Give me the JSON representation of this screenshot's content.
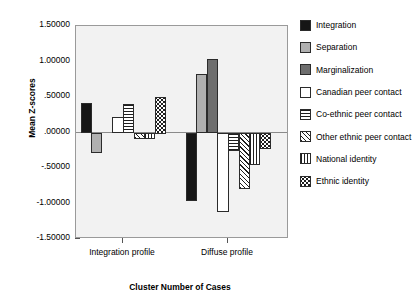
{
  "chart_data": {
    "type": "bar",
    "title": "",
    "xlabel": "Cluster Number of Cases",
    "ylabel": "Mean Z-scores",
    "categories": [
      "Integration profile",
      "Diffuse profile"
    ],
    "ylim": [
      -1.5,
      1.5
    ],
    "ytick_labels": [
      "1.50000",
      "1.00000",
      ".50000",
      ".00000",
      "-.50000",
      "-1.00000",
      "-1.50000"
    ],
    "ytick_values": [
      1.5,
      1.0,
      0.5,
      0.0,
      -0.5,
      -1.0,
      -1.5
    ],
    "grid": false,
    "legend_position": "right",
    "series": [
      {
        "name": "Integration",
        "pattern": "solid-black",
        "values": [
          0.42,
          -0.95
        ]
      },
      {
        "name": "Separation",
        "pattern": "solid-light-gray",
        "values": [
          -0.28,
          0.83
        ]
      },
      {
        "name": "Marginalization",
        "pattern": "solid-dark-gray",
        "values": [
          0.0,
          1.03
        ]
      },
      {
        "name": "Canadian peer contact",
        "pattern": "white",
        "values": [
          0.22,
          -1.1
        ]
      },
      {
        "name": "Co-ethnic peer contact",
        "pattern": "horizontal-lines",
        "values": [
          0.4,
          -0.25
        ]
      },
      {
        "name": "Other ethnic peer contact",
        "pattern": "diagonal-hatch",
        "values": [
          -0.08,
          -0.78
        ]
      },
      {
        "name": "National identity",
        "pattern": "vertical-lines",
        "values": [
          -0.08,
          -0.45
        ]
      },
      {
        "name": "Ethnic identity",
        "pattern": "dotted",
        "values": [
          0.5,
          -0.22
        ]
      }
    ]
  },
  "legend": {
    "items": [
      {
        "label": "Integration"
      },
      {
        "label": "Separation"
      },
      {
        "label": "Marginalization"
      },
      {
        "label": "Canadian peer contact"
      },
      {
        "label": "Co-ethnic peer contact"
      },
      {
        "label": "Other ethnic peer contact"
      },
      {
        "label": "National identity"
      },
      {
        "label": "Ethnic identity"
      }
    ]
  },
  "colors": {
    "plot_background": "#f2f2f2",
    "frame": "#9a9a9a",
    "integration": "#161616",
    "separation": "#b0b0b0",
    "marginalization": "#6e6e6e",
    "canadian": "#ffffff",
    "pattern_ink": "#1f1f1f"
  }
}
